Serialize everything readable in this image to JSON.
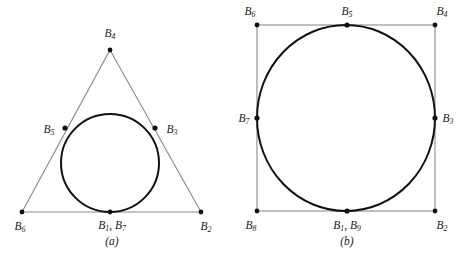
{
  "figure": {
    "background_color": "#ffffff",
    "line_color_thin": "#8a8a8a",
    "curve_color": "#111111",
    "point_color": "#111111",
    "text_color": "#1a1a1a"
  },
  "panels": [
    {
      "id": "panel-a",
      "caption": "(a)",
      "caption_x": 112,
      "caption_y": 241,
      "shape": "triangle-with-inscribed-circle",
      "polygon": {
        "vertices": [
          {
            "x": 110,
            "y": 50
          },
          {
            "x": 201,
            "y": 212
          },
          {
            "x": 22,
            "y": 212
          }
        ]
      },
      "circle": {
        "cx": 110,
        "cy": 163,
        "r": 49
      },
      "points": [
        {
          "name": "B4",
          "label": "B",
          "sub": "4",
          "x": 110,
          "y": 50,
          "lx": 110,
          "ly": 34,
          "align": "center"
        },
        {
          "name": "B5",
          "label": "B",
          "sub": "5",
          "x": 65,
          "y": 128,
          "lx": 49,
          "ly": 130,
          "align": "center"
        },
        {
          "name": "B3",
          "label": "B",
          "sub": "3",
          "x": 155,
          "y": 128,
          "lx": 172,
          "ly": 130,
          "align": "center"
        },
        {
          "name": "B6",
          "label": "B",
          "sub": "6",
          "x": 22,
          "y": 212,
          "lx": 20,
          "ly": 227,
          "align": "center"
        },
        {
          "name": "B2",
          "label": "B",
          "sub": "2",
          "x": 201,
          "y": 212,
          "lx": 206,
          "ly": 227,
          "align": "center"
        },
        {
          "name": "B1B7",
          "label": "B",
          "sub": "1",
          "label2": ", B",
          "sub2": "7",
          "x": 110,
          "y": 212,
          "lx": 112,
          "ly": 226,
          "align": "center"
        }
      ]
    },
    {
      "id": "panel-b",
      "caption": "(b)",
      "caption_x": 347,
      "caption_y": 241,
      "shape": "square-with-inscribed-circle",
      "polygon": {
        "vertices": [
          {
            "x": 257,
            "y": 25
          },
          {
            "x": 435,
            "y": 25
          },
          {
            "x": 435,
            "y": 211
          },
          {
            "x": 257,
            "y": 211
          }
        ]
      },
      "circle": {
        "cx": 346,
        "cy": 118,
        "rx": 89,
        "ry": 93
      },
      "points": [
        {
          "name": "B6",
          "label": "B",
          "sub": "6",
          "x": 257,
          "y": 25,
          "lx": 250,
          "ly": 12,
          "align": "center"
        },
        {
          "name": "B5",
          "label": "B",
          "sub": "5",
          "x": 347,
          "y": 25,
          "lx": 347,
          "ly": 12,
          "align": "center"
        },
        {
          "name": "B4",
          "label": "B",
          "sub": "4",
          "x": 435,
          "y": 25,
          "lx": 442,
          "ly": 12,
          "align": "center"
        },
        {
          "name": "B7",
          "label": "B",
          "sub": "7",
          "x": 257,
          "y": 118,
          "lx": 244,
          "ly": 119,
          "align": "center"
        },
        {
          "name": "B3",
          "label": "B",
          "sub": "3",
          "x": 435,
          "y": 118,
          "lx": 448,
          "ly": 119,
          "align": "center"
        },
        {
          "name": "B8",
          "label": "B",
          "sub": "8",
          "x": 257,
          "y": 211,
          "lx": 251,
          "ly": 226,
          "align": "center"
        },
        {
          "name": "B2",
          "label": "B",
          "sub": "2",
          "x": 435,
          "y": 211,
          "lx": 442,
          "ly": 226,
          "align": "center"
        },
        {
          "name": "B1B9",
          "label": "B",
          "sub": "1",
          "label2": ", B",
          "sub2": "9",
          "x": 347,
          "y": 211,
          "lx": 347,
          "ly": 226,
          "align": "center"
        }
      ]
    }
  ]
}
